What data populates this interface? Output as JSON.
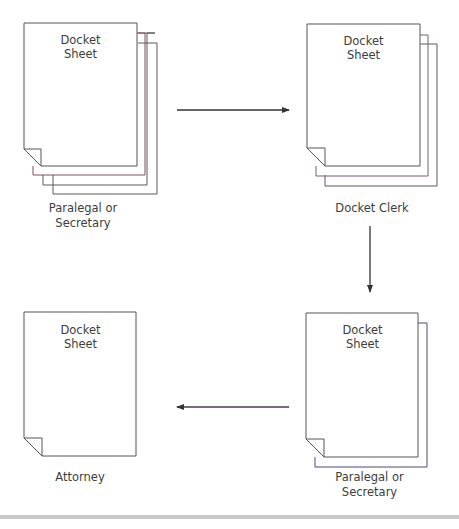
{
  "diagram": {
    "type": "document-flow",
    "nodes": [
      {
        "id": "paralegal-secretary-1",
        "document_title_line1": "Docket",
        "document_title_line2": "Sheet",
        "caption_line1": "Paralegal or",
        "caption_line2": "Secretary",
        "copies": 4
      },
      {
        "id": "docket-clerk",
        "document_title_line1": "Docket",
        "document_title_line2": "Sheet",
        "caption_line1": "Docket Clerk",
        "copies": 3
      },
      {
        "id": "paralegal-secretary-2",
        "document_title_line1": "Docket",
        "document_title_line2": "Sheet",
        "caption_line1": "Paralegal or",
        "caption_line2": "Secretary",
        "copies": 2
      },
      {
        "id": "attorney",
        "document_title_line1": "Docket",
        "document_title_line2": "Sheet",
        "caption_line1": "Attorney",
        "copies": 1
      }
    ],
    "edges": [
      {
        "from": "paralegal-secretary-1",
        "to": "docket-clerk",
        "direction": "right"
      },
      {
        "from": "docket-clerk",
        "to": "paralegal-secretary-2",
        "direction": "down"
      },
      {
        "from": "paralegal-secretary-2",
        "to": "attorney",
        "direction": "left"
      }
    ],
    "colors": {
      "page_stroke": "#555555",
      "arrow": "#333333",
      "bottom_bar": "#c8c8c8"
    }
  }
}
